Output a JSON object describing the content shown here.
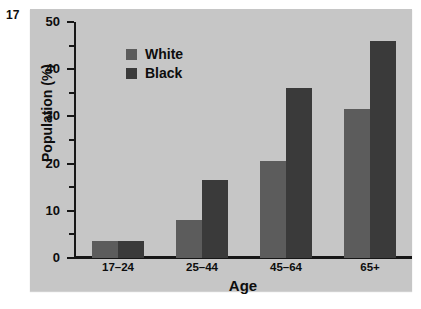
{
  "figure": {
    "number": "17"
  },
  "chart_data": {
    "type": "bar",
    "title": "",
    "xlabel": "Age",
    "ylabel": "Population (%)",
    "categories": [
      "17–24",
      "25–44",
      "45–64",
      "65+"
    ],
    "series": [
      {
        "name": "White",
        "color": "#5c5c5c",
        "values": [
          3.5,
          8.0,
          20.5,
          31.5
        ]
      },
      {
        "name": "Black",
        "color": "#3a3a3a",
        "values": [
          3.7,
          16.5,
          36.0,
          46.0
        ]
      }
    ],
    "ylim": [
      0,
      50
    ],
    "ytick_labels": [
      "0",
      "10",
      "20",
      "30",
      "40",
      "50"
    ],
    "ytick_values": [
      0,
      10,
      20,
      30,
      40,
      50
    ],
    "yminor_values": [
      5,
      15,
      25,
      35,
      45
    ],
    "grid": false,
    "legend_position": "upper-left-inside",
    "panel_background": "#c6c6c6",
    "axis_color": "#161616"
  }
}
